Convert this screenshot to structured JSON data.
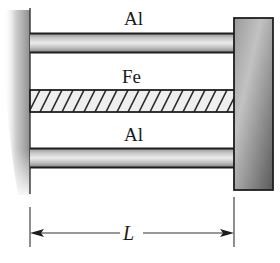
{
  "diagram": {
    "type": "mechanics-figure",
    "members": [
      {
        "id": "top-rod",
        "label": "Al",
        "material": "aluminum",
        "style": "shaded-rod"
      },
      {
        "id": "middle-bar",
        "label": "Fe",
        "material": "iron",
        "style": "hatched"
      },
      {
        "id": "bottom-rod",
        "label": "Al",
        "material": "aluminum",
        "style": "shaded-rod"
      }
    ],
    "supports": {
      "left": "fixed-wall",
      "right": "rigid-plate"
    },
    "dimension": {
      "label": "L",
      "spans": "wall to plate"
    },
    "colors": {
      "outline": "#1e1e1e",
      "rod_light": "#e6e6e6",
      "rod_dark": "#8a8a8a",
      "plate_light": "#b4b4b4",
      "plate_dark": "#5a5a5a",
      "wall_shade": "#9a9a9a"
    }
  }
}
